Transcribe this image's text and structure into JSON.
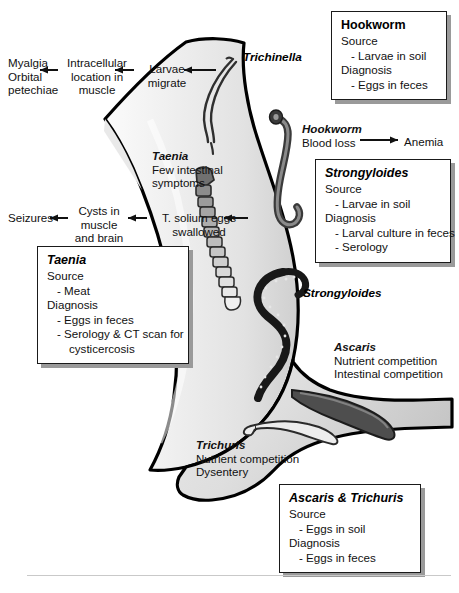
{
  "boxes": [
    {
      "id": "hookworm",
      "title": "Hookworm",
      "title_italic": false,
      "lines": [
        {
          "text": "Source",
          "indent": 0
        },
        {
          "text": "- Larvae in soil",
          "indent": 1
        },
        {
          "text": "Diagnosis",
          "indent": 0
        },
        {
          "text": "- Eggs in feces",
          "indent": 1
        }
      ]
    },
    {
      "id": "strongyloides",
      "title": "Strongyloides",
      "title_italic": true,
      "lines": [
        {
          "text": "Source",
          "indent": 0
        },
        {
          "text": "- Larvae in soil",
          "indent": 1
        },
        {
          "text": "Diagnosis",
          "indent": 0
        },
        {
          "text": "- Larval culture in feces",
          "indent": 1
        },
        {
          "text": "- Serology",
          "indent": 1
        }
      ]
    },
    {
      "id": "taenia",
      "title": "Taenia",
      "title_italic": true,
      "lines": [
        {
          "text": "Source",
          "indent": 0
        },
        {
          "text": "- Meat",
          "indent": 1
        },
        {
          "text": "Diagnosis",
          "indent": 0
        },
        {
          "text": "- Eggs in feces",
          "indent": 1
        },
        {
          "text": "- Serology & CT scan for",
          "indent": 1
        },
        {
          "text": "cysticercosis",
          "indent": 2
        }
      ]
    },
    {
      "id": "ascaris-trichuris",
      "title": "Ascaris & Trichuris",
      "title_italic": true,
      "lines": [
        {
          "text": "Source",
          "indent": 0
        },
        {
          "text": "- Eggs in soil",
          "indent": 1
        },
        {
          "text": "Diagnosis",
          "indent": 0
        },
        {
          "text": "- Eggs in feces",
          "indent": 1
        }
      ]
    }
  ],
  "trichinella_flow": {
    "outcome_line1": "Myalgia",
    "outcome_line2": "Orbital",
    "outcome_line3": "petechiae",
    "step2_line1": "Intracellular",
    "step2_line2": "location in",
    "step2_line3": "muscle",
    "step1_line1": "Larvae",
    "step1_line2": "migrate",
    "genus": "Trichinella"
  },
  "taenia_flow": {
    "outcome": "Seizures",
    "step2_line1": "Cysts in",
    "step2_line2": "muscle",
    "step2_line3": "and brain",
    "step1_line1": "T. solium eggs",
    "step1_line2": "swallowed"
  },
  "taenia_note": {
    "genus": "Taenia",
    "line1": "Few intestinal",
    "line2": "symptoms"
  },
  "hookworm_note": {
    "genus": "Hookworm",
    "cause": "Blood loss",
    "effect": "Anemia"
  },
  "ascaris_note": {
    "genus": "Ascaris",
    "line1": "Nutrient competition",
    "line2": "Intestinal competition"
  },
  "trichuris_note": {
    "genus": "Trichuris",
    "line1": "Nutrient competition",
    "line2": "Dysentery"
  },
  "inline_labels": {
    "trichinella": "Trichinella",
    "hookworm": "Hookworm",
    "strongyloides": "Strongyloides"
  },
  "colors": {
    "outline": "#000000",
    "gut_fill_light": "#f2f2f2",
    "gut_fill_mid": "#e3e3e3",
    "gut_fill_dark": "#cfcfcf",
    "worm_dark": "#2b2b2b",
    "worm_mid": "#6f6f6f",
    "worm_light": "#d8d8d8",
    "box_border": "#1a1a1a",
    "box_shadow": "#9a9a9a",
    "rule": "#c9c9c9"
  }
}
